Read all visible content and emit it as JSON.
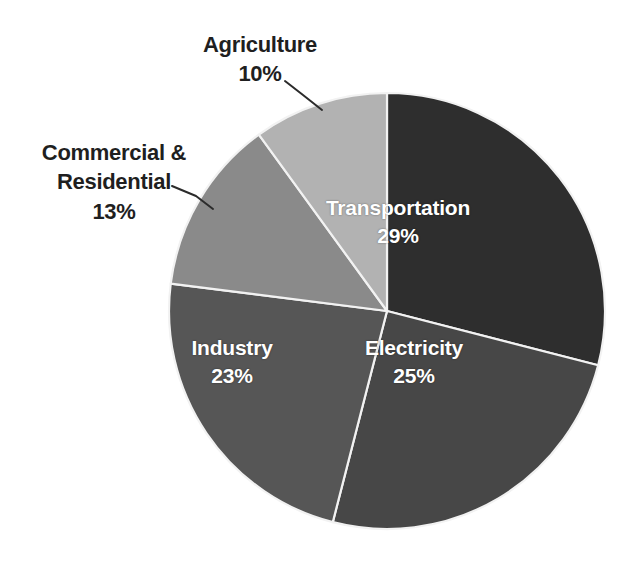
{
  "chart_data": {
    "type": "pie",
    "title": "",
    "subtitle": "",
    "xlabel": "",
    "ylabel": "",
    "legend_position": "none",
    "grid": false,
    "value_unit": "%",
    "total": 100,
    "start_angle_deg": 0,
    "direction": "clockwise",
    "categories": [
      "Transportation",
      "Electricity",
      "Industry",
      "Commercial & Residential",
      "Agriculture"
    ],
    "values": [
      29,
      25,
      23,
      13,
      10
    ],
    "slices": [
      {
        "label": "Transportation",
        "label_line1": "Transportation",
        "label_line2": "29%",
        "value": 29,
        "value_text": "29%",
        "color": "#2e2e2e",
        "label_placement": "inside",
        "label_color": "#ffffff"
      },
      {
        "label": "Electricity",
        "label_line1": "Electricity",
        "label_line2": "25%",
        "value": 25,
        "value_text": "25%",
        "color": "#474747",
        "label_placement": "inside",
        "label_color": "#ffffff"
      },
      {
        "label": "Industry",
        "label_line1": "Industry",
        "label_line2": "23%",
        "value": 23,
        "value_text": "23%",
        "color": "#565656",
        "label_placement": "inside",
        "label_color": "#ffffff"
      },
      {
        "label": "Commercial & Residential",
        "label_line1": "Commercial &",
        "label_line2": "Residential",
        "label_line3": "13%",
        "value": 13,
        "value_text": "13%",
        "color": "#8a8a8a",
        "label_placement": "outside",
        "label_color": "#1f1f1f"
      },
      {
        "label": "Agriculture",
        "label_line1": "Agriculture",
        "label_line2": "10%",
        "value": 10,
        "value_text": "10%",
        "color": "#b2b2b2",
        "label_placement": "outside",
        "label_color": "#1f1f1f"
      }
    ]
  },
  "geometry": {
    "center_x": 387,
    "center_y": 311,
    "radius": 218,
    "slice_border_color": "#f2f2f2",
    "background": "#ffffff"
  },
  "leader_lines": [
    {
      "name": "leader-agriculture",
      "points": "285,81 303,95 322,110"
    },
    {
      "name": "leader-commercial",
      "points": "172,186 196,196 213,209"
    }
  ]
}
